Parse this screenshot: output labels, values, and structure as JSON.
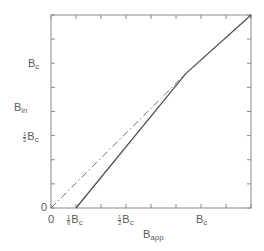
{
  "chart_data": {
    "type": "line",
    "title": "",
    "xlabel": "B_app",
    "ylabel": "B_in",
    "x_unit": "B_c",
    "xlim": [
      0,
      1.333
    ],
    "ylim": [
      0,
      1.333
    ],
    "grid": false,
    "legend": null,
    "x_ticks": [
      0,
      0.1667,
      0.3333,
      0.5,
      0.6667,
      0.8333,
      1.0,
      1.1667,
      1.3333
    ],
    "y_ticks": [
      0,
      0.1667,
      0.3333,
      0.5,
      0.6667,
      0.8333,
      1.0,
      1.1667,
      1.3333
    ],
    "x_tick_labels": [
      {
        "value": 0,
        "text": "0"
      },
      {
        "value": 0.1667,
        "num": "1",
        "den": "6",
        "text": "B",
        "sub": "c"
      },
      {
        "value": 0.5,
        "num": "1",
        "den": "2",
        "text": "B",
        "sub": "c"
      },
      {
        "value": 1.0,
        "text": "B",
        "sub": "c"
      }
    ],
    "y_tick_labels": [
      {
        "value": 0,
        "text": "0"
      },
      {
        "value": 0.5,
        "num": "1",
        "den": "2",
        "text": "B",
        "sub": "c"
      },
      {
        "value": 1.0,
        "text": "B",
        "sub": "c"
      }
    ],
    "series": [
      {
        "name": "B_in = B_app (reference)",
        "style": "dash-dot",
        "color": "#707070",
        "points": [
          [
            0,
            0
          ],
          [
            0.9,
            0.93
          ]
        ]
      },
      {
        "name": "B_in",
        "style": "solid",
        "color": "#4a4a4a",
        "points": [
          [
            0.1667,
            0
          ],
          [
            0.9,
            0.93
          ],
          [
            1.3333,
            1.3333
          ]
        ]
      }
    ]
  },
  "labels": {
    "x_axis": {
      "main": "B",
      "sub": "app"
    },
    "y_axis": {
      "main": "B",
      "sub": "in"
    },
    "origin_x": "0",
    "origin_y": "0",
    "x_sixth": {
      "num": "1",
      "den": "6",
      "main": "B",
      "sub": "c"
    },
    "x_half": {
      "num": "1",
      "den": "2",
      "main": "B",
      "sub": "c"
    },
    "x_one": {
      "main": "B",
      "sub": "c"
    },
    "y_half": {
      "num": "1",
      "den": "2",
      "main": "B",
      "sub": "c"
    },
    "y_one": {
      "main": "B",
      "sub": "c"
    }
  }
}
